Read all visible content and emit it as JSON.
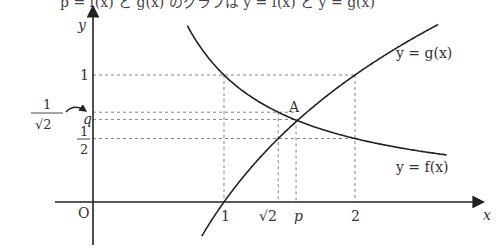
{
  "top_text_cutoff": "p = f(x) と g(x) のグラフは y = f(x) と y = g(x)",
  "diagram": {
    "type": "function-graph",
    "axes": {
      "x_label": "x",
      "y_label": "y",
      "origin_label": "O"
    },
    "curves": [
      {
        "name": "f",
        "label": "y = f(x)",
        "description": "decreasing curve, f(x)=1/x",
        "x_range": [
          0.68,
          2.7
        ]
      },
      {
        "name": "g",
        "label": "y = g(x)",
        "description": "increasing curve, g(x)=log2(x)",
        "x_range": [
          0.83,
          2.7
        ]
      }
    ],
    "intersection": {
      "label": "A",
      "x_label": "p",
      "y_label": "q",
      "x": 1.55,
      "y": 0.65
    },
    "x_ticks": [
      {
        "label": "1",
        "value": 1
      },
      {
        "label": "√2",
        "value": 1.414
      },
      {
        "label": "p",
        "value": 1.55
      },
      {
        "label": "2",
        "value": 2
      }
    ],
    "y_ticks": [
      {
        "label": "1",
        "value": 1
      },
      {
        "label": "1/√2",
        "value": 0.707
      },
      {
        "label": "q",
        "value": 0.65
      },
      {
        "label": "1/2",
        "value": 0.5
      }
    ],
    "frac_half": {
      "num": "1",
      "den": "2"
    },
    "frac_inv_sqrt2": {
      "num": "1",
      "den": "√2"
    }
  }
}
